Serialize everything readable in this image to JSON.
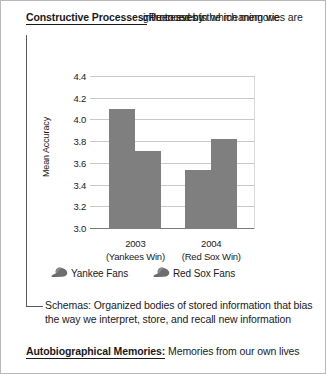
{
  "definitions": {
    "constructive": {
      "term": "Constructive Processes:",
      "body_line1": "Processes in which memories are",
      "body_line2": "influenced by the meaning we",
      "body_line3": "give to events"
    },
    "schemas": {
      "term": "Schemas:",
      "body": " Organized bodies of stored information that bias the way we interpret, store, and recall new information"
    },
    "autobiographical": {
      "term": "Autobiographical Memories:",
      "body": " Memories from our own lives"
    }
  },
  "chart_data": {
    "type": "bar",
    "title": "",
    "xlabel": "",
    "ylabel": "Mean Accuracy",
    "ylim": [
      3.0,
      4.4
    ],
    "yticks": [
      "3.0",
      "3.2",
      "3.4",
      "3.6",
      "3.8",
      "4.0",
      "4.2",
      "4.4"
    ],
    "grid": true,
    "legend_position": "bottom",
    "categories": [
      "2003",
      "2004"
    ],
    "category_sublabels": [
      "(Yankees Win)",
      "(Red Sox Win)"
    ],
    "series": [
      {
        "name": "Yankee Fans",
        "values": [
          4.11,
          3.54
        ],
        "color": "#7f7f7f",
        "icon": "baseball-cap-icon"
      },
      {
        "name": "Red Sox Fans",
        "values": [
          3.72,
          3.83
        ],
        "color": "#7f7f7f",
        "icon": "baseball-cap-icon"
      }
    ]
  }
}
